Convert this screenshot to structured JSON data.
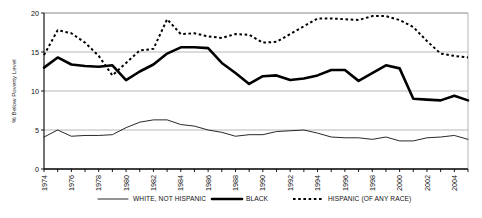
{
  "chart_data": {
    "type": "line",
    "title": "",
    "xlabel": "",
    "ylabel": "% Below Poverty Level",
    "ylim": [
      0,
      20
    ],
    "yticks": [
      0,
      5,
      10,
      15,
      20
    ],
    "xlim": [
      1974,
      2005
    ],
    "xticks": [
      1974,
      1976,
      1978,
      1980,
      1982,
      1984,
      1986,
      1988,
      1990,
      1992,
      1994,
      1996,
      1998,
      2000,
      2002,
      2004
    ],
    "xtick_labels": [
      "1974",
      "1976",
      "1978",
      "1980",
      "1982",
      "1984",
      "1986",
      "1988",
      "1990",
      "1992",
      "1994",
      "1996",
      "1998",
      "2000",
      "2002",
      "2004"
    ],
    "grid": true,
    "legend_position": "bottom",
    "x": [
      1974,
      1975,
      1976,
      1977,
      1978,
      1979,
      1980,
      1981,
      1982,
      1983,
      1984,
      1985,
      1986,
      1987,
      1988,
      1989,
      1990,
      1991,
      1992,
      1993,
      1994,
      1995,
      1996,
      1997,
      1998,
      1999,
      2000,
      2001,
      2002,
      2003,
      2004,
      2005
    ],
    "series": [
      {
        "name": "WHITE, NOT HISPANIC",
        "style": "thin-solid",
        "color": "#111111",
        "values": [
          4.1,
          5.0,
          4.2,
          4.3,
          4.3,
          4.4,
          5.3,
          6.0,
          6.3,
          6.3,
          5.7,
          5.5,
          5.0,
          4.7,
          4.2,
          4.4,
          4.4,
          4.8,
          4.9,
          5.0,
          4.6,
          4.1,
          4.0,
          4.0,
          3.8,
          4.1,
          3.6,
          3.6,
          4.0,
          4.1,
          4.3,
          3.8
        ]
      },
      {
        "name": "BLACK",
        "style": "thick-solid",
        "color": "#000000",
        "values": [
          13.0,
          14.3,
          13.4,
          13.2,
          13.1,
          13.3,
          11.4,
          12.5,
          13.4,
          14.8,
          15.6,
          15.6,
          15.5,
          13.6,
          12.3,
          10.9,
          11.9,
          12.0,
          11.4,
          11.6,
          12.0,
          12.7,
          12.7,
          11.3,
          12.3,
          13.3,
          12.9,
          9.0,
          8.9,
          8.8,
          9.4,
          8.8
        ]
      },
      {
        "name": "HISPANIC (OF ANY RACE)",
        "style": "dashed",
        "color": "#000000",
        "values": [
          14.6,
          17.8,
          17.4,
          16.2,
          14.5,
          12.0,
          13.6,
          15.2,
          15.4,
          19.2,
          17.3,
          17.4,
          17.0,
          16.8,
          17.3,
          17.2,
          16.2,
          16.3,
          17.3,
          18.3,
          19.3,
          19.3,
          19.2,
          19.1,
          19.6,
          19.6,
          19.1,
          18.2,
          16.4,
          14.8,
          14.5,
          14.3
        ]
      }
    ],
    "series_black_detail": [
      13.0,
      14.3,
      13.4,
      13.2,
      13.1,
      13.3,
      11.4,
      12.5,
      13.4,
      14.8,
      15.6,
      15.6,
      15.5,
      13.6,
      12.3,
      10.9,
      11.9,
      12.0,
      11.4,
      11.6,
      12.0,
      12.7,
      12.7,
      11.3,
      12.3,
      13.3,
      12.9,
      9.0,
      8.9,
      8.8,
      9.4,
      8.8
    ]
  },
  "legend": {
    "items": [
      {
        "label": "WHITE, NOT HISPANIC",
        "style": "thin-solid"
      },
      {
        "label": "BLACK",
        "style": "thick-solid"
      },
      {
        "label": "HISPANIC (OF ANY RACE)",
        "style": "dashed"
      }
    ]
  },
  "axis": {
    "y_title": "% Below Poverty Level"
  }
}
